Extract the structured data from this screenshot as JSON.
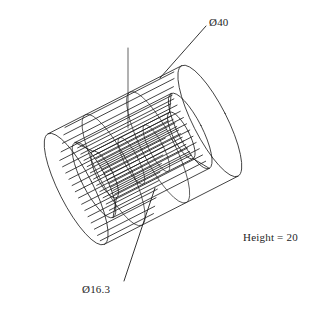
{
  "drawing": {
    "title": "3D wireframe isometric view of a hollow cylinder",
    "background_color": "#ffffff",
    "line_color": "#1a1a1a",
    "annotations": [
      {
        "id": "outer-diameter",
        "text": "Ø40",
        "meaning": "outer diameter 40",
        "leader": {
          "x1": 206,
          "y1": 26,
          "x2": 160,
          "y2": 78
        }
      },
      {
        "id": "bore-diameter",
        "text": "Ø16.3",
        "meaning": "bore diameter 16.3",
        "leader": {
          "x1": 124,
          "y1": 281,
          "x2": 155,
          "y2": 188
        }
      },
      {
        "id": "height-note",
        "text": "Height = 20",
        "meaning": "cylinder height 20"
      }
    ]
  },
  "geometry": {
    "axis_angle_deg": -27,
    "outer_radius_px": 62,
    "inner_radius_px": 25,
    "mid_radius_px": 40,
    "length_px": 150,
    "center": {
      "x": 143,
      "y": 155
    },
    "ruling_count_outer": 26,
    "ruling_count_inner": 22
  }
}
